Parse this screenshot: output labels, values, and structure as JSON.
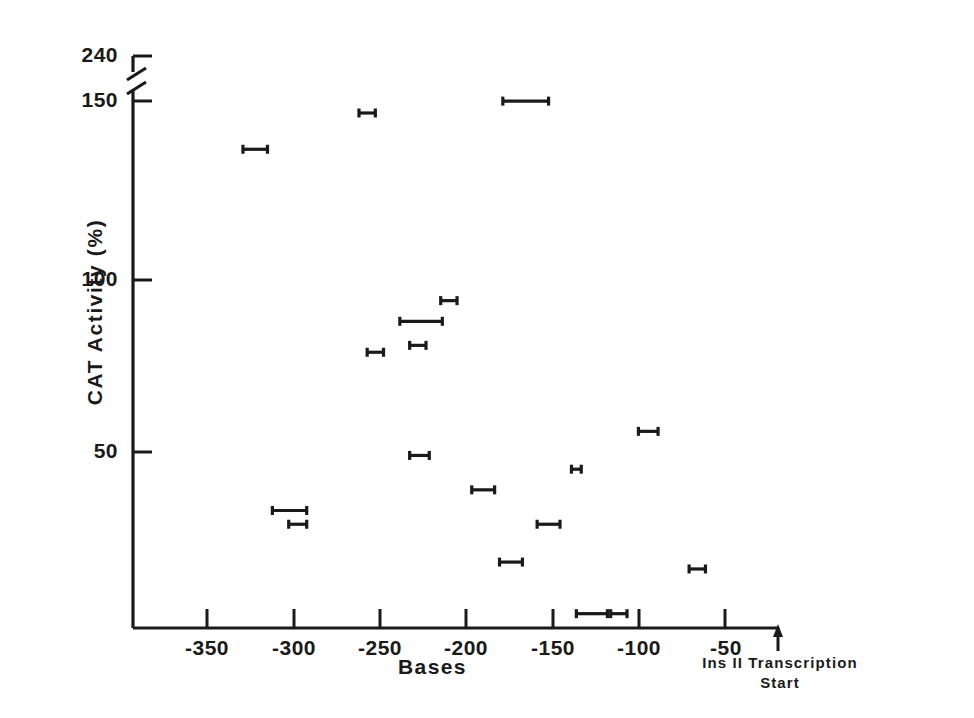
{
  "figure": {
    "background_color": "#ffffff",
    "ink_color": "#1a1a1a"
  },
  "axes": {
    "y_axis_title": "CAT Activity (%)",
    "x_axis_title": "Bases",
    "origin_annotation_line1": "Ins II Transcription",
    "origin_annotation_line2": "Start",
    "y_tick_labels": [
      "240",
      "150",
      "100",
      "50"
    ],
    "x_tick_labels": [
      "-350",
      "-300",
      "-250",
      "-200",
      "-150",
      "-100",
      "-50"
    ],
    "y_axis_has_break": true,
    "break_between": [
      "150",
      "240"
    ]
  },
  "chart_data": {
    "type": "scatter",
    "title": "",
    "xlabel": "Bases",
    "ylabel": "CAT Activity (%)",
    "xlim": [
      -390,
      0
    ],
    "ylim": [
      0,
      160
    ],
    "ylim_top_segment": [
      150,
      245
    ],
    "y_axis_break": true,
    "y_break_low": 155,
    "y_break_high": 232,
    "grid": false,
    "legend": null,
    "x_ticks": [
      -350,
      -300,
      -250,
      -200,
      -150,
      -100,
      -50
    ],
    "y_ticks": [
      50,
      100,
      150,
      240
    ],
    "marker_style": "horizontal-range-bar-with-end-caps",
    "origin_marker": "up-arrow at x=0 labelled Ins II Transcription Start",
    "points": [
      {
        "x": -252,
        "y": 238,
        "x_low": -257,
        "x_high": -247
      },
      {
        "x": -155,
        "y": 152,
        "x_low": -169,
        "x_high": -141
      },
      {
        "x": -320,
        "y": 138,
        "x_low": -328,
        "x_high": -313
      },
      {
        "x": -202,
        "y": 94,
        "x_low": -207,
        "x_high": -197
      },
      {
        "x": -219,
        "y": 88,
        "x_low": -232,
        "x_high": -206
      },
      {
        "x": -221,
        "y": 81,
        "x_low": -226,
        "x_high": -216
      },
      {
        "x": -247,
        "y": 79,
        "x_low": -252,
        "x_high": -242
      },
      {
        "x": -220,
        "y": 49,
        "x_low": -226,
        "x_high": -214
      },
      {
        "x": -181,
        "y": 39,
        "x_low": -188,
        "x_high": -174
      },
      {
        "x": -124,
        "y": 45,
        "x_low": -127,
        "x_high": -121
      },
      {
        "x": -80,
        "y": 56,
        "x_low": -86,
        "x_high": -74
      },
      {
        "x": -299,
        "y": 33,
        "x_low": -310,
        "x_high": -289
      },
      {
        "x": -294,
        "y": 29,
        "x_low": -300,
        "x_high": -289
      },
      {
        "x": -141,
        "y": 29,
        "x_low": -148,
        "x_high": -134
      },
      {
        "x": -164,
        "y": 18,
        "x_low": -171,
        "x_high": -157
      },
      {
        "x": -50,
        "y": 16,
        "x_low": -55,
        "x_high": -45
      },
      {
        "x": -114,
        "y": 3,
        "x_low": -124,
        "x_high": -105
      },
      {
        "x": -98,
        "y": 3,
        "x_low": -103,
        "x_high": -93
      }
    ]
  }
}
